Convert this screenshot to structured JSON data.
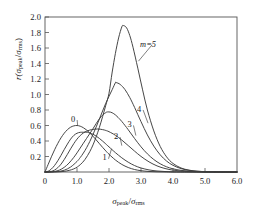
{
  "figure": {
    "name": "peak-distribution-chart",
    "background": "#ffffff",
    "line_color": "#3c3c3c",
    "axis_color": "#555555",
    "text_color": "#1a1a1a"
  },
  "axis_text": {
    "y_label_prefix": "r(",
    "y_label_num": "σ",
    "y_label_num_sub": "peak",
    "y_label_slash": "/",
    "y_label_den": "σ",
    "y_label_den_sub": "rms",
    "y_label_suffix": ")",
    "x_label_num": "σ",
    "x_label_num_sub": "peak",
    "x_label_slash": "/",
    "x_label_den": "σ",
    "x_label_den_sub": "rms"
  },
  "chart_data": {
    "type": "line",
    "title": "",
    "xlabel": "σpeak/σrms",
    "ylabel": "r(σpeak/σrms)",
    "xlim": [
      0.0,
      6.0
    ],
    "ylim": [
      0.0,
      2.0
    ],
    "xticks": [
      0.0,
      1.0,
      2.0,
      3.0,
      4.0,
      5.0,
      6.0
    ],
    "xticklabels": [
      "0",
      "1.0",
      "2.0",
      "3.0",
      "4.0",
      "5.0",
      "6.0"
    ],
    "yticks": [
      0.0,
      0.2,
      0.4,
      0.6,
      0.8,
      1.0,
      1.2,
      1.4,
      1.6,
      1.8,
      2.0
    ],
    "yticklabels": [
      "",
      "0.2",
      "0.4",
      "0.6",
      "0.8",
      "1.0",
      "1.2",
      "1.4",
      "1.6",
      "1.8",
      "2.0"
    ],
    "grid": false,
    "legend": "inline-annotations",
    "crossing_point": [
      1.4,
      0.5
    ],
    "annotations": [
      {
        "text": "0",
        "x": 0.88,
        "y": 0.69,
        "leader_to": [
          1.02,
          0.6
        ]
      },
      {
        "text": "1",
        "x": 1.86,
        "y": 0.19,
        "leader_to": [
          2.08,
          0.3
        ]
      },
      {
        "text": "2",
        "x": 2.22,
        "y": 0.47,
        "leader_to": [
          2.4,
          0.34
        ]
      },
      {
        "text": "3",
        "x": 2.64,
        "y": 0.62,
        "leader_to": [
          2.84,
          0.47
        ]
      },
      {
        "text": "4",
        "x": 2.94,
        "y": 0.82,
        "leader_to": [
          3.22,
          0.63
        ]
      },
      {
        "text": "m=5",
        "x": 3.22,
        "y": 1.66,
        "leader_to": [
          2.92,
          1.43
        ]
      }
    ],
    "series": [
      {
        "name": "m=0",
        "label": "0",
        "peak": [
          1.0,
          0.6
        ],
        "points": [
          [
            0.0,
            0.0
          ],
          [
            0.1,
            0.099
          ],
          [
            0.2,
            0.196
          ],
          [
            0.3,
            0.287
          ],
          [
            0.4,
            0.369
          ],
          [
            0.5,
            0.441
          ],
          [
            0.6,
            0.5
          ],
          [
            0.7,
            0.546
          ],
          [
            0.8,
            0.578
          ],
          [
            0.9,
            0.595
          ],
          [
            1.0,
            0.6
          ],
          [
            1.1,
            0.591
          ],
          [
            1.2,
            0.571
          ],
          [
            1.3,
            0.542
          ],
          [
            1.4,
            0.504
          ],
          [
            1.5,
            0.461
          ],
          [
            1.6,
            0.414
          ],
          [
            1.7,
            0.366
          ],
          [
            1.8,
            0.318
          ],
          [
            1.9,
            0.272
          ],
          [
            2.0,
            0.229
          ],
          [
            2.2,
            0.155
          ],
          [
            2.4,
            0.098
          ],
          [
            2.6,
            0.058
          ],
          [
            2.8,
            0.032
          ],
          [
            3.0,
            0.017
          ],
          [
            3.25,
            0.007
          ],
          [
            3.5,
            0.003
          ],
          [
            3.75,
            0.001
          ],
          [
            4.0,
            0.0
          ],
          [
            4.5,
            0.0
          ],
          [
            5.0,
            0.0
          ],
          [
            5.5,
            0.0
          ],
          [
            6.0,
            0.0
          ]
        ]
      },
      {
        "name": "m=1",
        "label": "1",
        "peak": [
          1.32,
          0.513
        ],
        "points": [
          [
            0.0,
            0.0
          ],
          [
            0.1,
            0.01
          ],
          [
            0.2,
            0.039
          ],
          [
            0.3,
            0.085
          ],
          [
            0.4,
            0.145
          ],
          [
            0.5,
            0.215
          ],
          [
            0.6,
            0.289
          ],
          [
            0.7,
            0.36
          ],
          [
            0.8,
            0.424
          ],
          [
            0.9,
            0.472
          ],
          [
            1.0,
            0.5
          ],
          [
            1.1,
            0.512
          ],
          [
            1.2,
            0.513
          ],
          [
            1.32,
            0.513
          ],
          [
            1.4,
            0.502
          ],
          [
            1.5,
            0.487
          ],
          [
            1.6,
            0.463
          ],
          [
            1.7,
            0.433
          ],
          [
            1.8,
            0.399
          ],
          [
            1.9,
            0.362
          ],
          [
            2.0,
            0.324
          ],
          [
            2.2,
            0.25
          ],
          [
            2.4,
            0.183
          ],
          [
            2.6,
            0.127
          ],
          [
            2.8,
            0.083
          ],
          [
            3.0,
            0.052
          ],
          [
            3.25,
            0.027
          ],
          [
            3.5,
            0.013
          ],
          [
            3.75,
            0.006
          ],
          [
            4.0,
            0.002
          ],
          [
            4.25,
            0.001
          ],
          [
            4.5,
            0.0
          ],
          [
            5.0,
            0.0
          ],
          [
            5.5,
            0.0
          ],
          [
            6.0,
            0.0
          ]
        ]
      },
      {
        "name": "m=2",
        "label": "2",
        "peak": [
          1.65,
          0.555
        ],
        "points": [
          [
            0.0,
            0.0
          ],
          [
            0.1,
            0.001
          ],
          [
            0.2,
            0.008
          ],
          [
            0.3,
            0.025
          ],
          [
            0.4,
            0.056
          ],
          [
            0.5,
            0.101
          ],
          [
            0.6,
            0.16
          ],
          [
            0.7,
            0.228
          ],
          [
            0.8,
            0.299
          ],
          [
            0.9,
            0.366
          ],
          [
            1.0,
            0.424
          ],
          [
            1.1,
            0.47
          ],
          [
            1.2,
            0.504
          ],
          [
            1.3,
            0.527
          ],
          [
            1.4,
            0.541
          ],
          [
            1.5,
            0.55
          ],
          [
            1.65,
            0.555
          ],
          [
            1.8,
            0.547
          ],
          [
            1.9,
            0.536
          ],
          [
            2.0,
            0.52
          ],
          [
            2.2,
            0.474
          ],
          [
            2.4,
            0.412
          ],
          [
            2.6,
            0.341
          ],
          [
            2.8,
            0.269
          ],
          [
            3.0,
            0.201
          ],
          [
            3.25,
            0.131
          ],
          [
            3.5,
            0.079
          ],
          [
            3.75,
            0.045
          ],
          [
            4.0,
            0.024
          ],
          [
            4.25,
            0.012
          ],
          [
            4.5,
            0.006
          ],
          [
            4.75,
            0.003
          ],
          [
            5.0,
            0.001
          ],
          [
            5.5,
            0.0
          ],
          [
            6.0,
            0.0
          ]
        ]
      },
      {
        "name": "m=3",
        "label": "3",
        "peak": [
          1.95,
          0.775
        ],
        "points": [
          [
            0.0,
            0.0
          ],
          [
            0.15,
            0.001
          ],
          [
            0.3,
            0.007
          ],
          [
            0.45,
            0.025
          ],
          [
            0.6,
            0.06
          ],
          [
            0.75,
            0.115
          ],
          [
            0.9,
            0.189
          ],
          [
            1.0,
            0.247
          ],
          [
            1.1,
            0.309
          ],
          [
            1.2,
            0.372
          ],
          [
            1.3,
            0.434
          ],
          [
            1.4,
            0.496
          ],
          [
            1.5,
            0.559
          ],
          [
            1.6,
            0.625
          ],
          [
            1.7,
            0.686
          ],
          [
            1.8,
            0.734
          ],
          [
            1.9,
            0.766
          ],
          [
            1.95,
            0.775
          ],
          [
            2.05,
            0.772
          ],
          [
            2.15,
            0.752
          ],
          [
            2.25,
            0.718
          ],
          [
            2.4,
            0.652
          ],
          [
            2.6,
            0.546
          ],
          [
            2.8,
            0.432
          ],
          [
            3.0,
            0.325
          ],
          [
            3.2,
            0.234
          ],
          [
            3.4,
            0.161
          ],
          [
            3.6,
            0.106
          ],
          [
            3.8,
            0.067
          ],
          [
            4.0,
            0.041
          ],
          [
            4.25,
            0.021
          ],
          [
            4.5,
            0.01
          ],
          [
            4.75,
            0.005
          ],
          [
            5.0,
            0.002
          ],
          [
            5.5,
            0.0
          ],
          [
            6.0,
            0.0
          ]
        ]
      },
      {
        "name": "m=4",
        "label": "4",
        "peak": [
          2.22,
          1.155
        ],
        "points": [
          [
            0.0,
            0.0
          ],
          [
            0.2,
            0.001
          ],
          [
            0.4,
            0.006
          ],
          [
            0.6,
            0.023
          ],
          [
            0.8,
            0.064
          ],
          [
            1.0,
            0.136
          ],
          [
            1.1,
            0.186
          ],
          [
            1.2,
            0.245
          ],
          [
            1.3,
            0.314
          ],
          [
            1.4,
            0.394
          ],
          [
            1.5,
            0.484
          ],
          [
            1.6,
            0.582
          ],
          [
            1.7,
            0.684
          ],
          [
            1.8,
            0.787
          ],
          [
            1.9,
            0.887
          ],
          [
            2.0,
            0.977
          ],
          [
            2.1,
            1.063
          ],
          [
            2.2,
            1.152
          ],
          [
            2.22,
            1.155
          ],
          [
            2.35,
            1.13
          ],
          [
            2.5,
            1.063
          ],
          [
            2.65,
            0.96
          ],
          [
            2.8,
            0.833
          ],
          [
            3.0,
            0.65
          ],
          [
            3.2,
            0.478
          ],
          [
            3.4,
            0.334
          ],
          [
            3.6,
            0.222
          ],
          [
            3.8,
            0.141
          ],
          [
            4.0,
            0.086
          ],
          [
            4.25,
            0.044
          ],
          [
            4.5,
            0.021
          ],
          [
            4.75,
            0.01
          ],
          [
            5.0,
            0.004
          ],
          [
            5.25,
            0.002
          ],
          [
            5.5,
            0.001
          ],
          [
            6.0,
            0.0
          ]
        ]
      },
      {
        "name": "m=5",
        "label": "m=5",
        "peak": [
          2.45,
          1.89
        ],
        "points": [
          [
            0.0,
            0.0
          ],
          [
            0.3,
            0.001
          ],
          [
            0.6,
            0.008
          ],
          [
            0.9,
            0.04
          ],
          [
            1.1,
            0.094
          ],
          [
            1.25,
            0.162
          ],
          [
            1.4,
            0.263
          ],
          [
            1.5,
            0.35
          ],
          [
            1.6,
            0.454
          ],
          [
            1.7,
            0.576
          ],
          [
            1.8,
            0.714
          ],
          [
            1.9,
            0.862
          ],
          [
            2.0,
            1.016
          ],
          [
            2.1,
            1.29
          ],
          [
            2.2,
            1.53
          ],
          [
            2.3,
            1.73
          ],
          [
            2.4,
            1.872
          ],
          [
            2.45,
            1.89
          ],
          [
            2.55,
            1.86
          ],
          [
            2.65,
            1.76
          ],
          [
            2.75,
            1.61
          ],
          [
            2.9,
            1.34
          ],
          [
            3.05,
            1.06
          ],
          [
            3.2,
            0.8
          ],
          [
            3.4,
            0.53
          ],
          [
            3.6,
            0.33
          ],
          [
            3.8,
            0.195
          ],
          [
            4.0,
            0.11
          ],
          [
            4.25,
            0.052
          ],
          [
            4.5,
            0.024
          ],
          [
            4.75,
            0.01
          ],
          [
            5.0,
            0.004
          ],
          [
            5.25,
            0.002
          ],
          [
            5.5,
            0.001
          ],
          [
            6.0,
            0.0
          ]
        ]
      }
    ]
  }
}
